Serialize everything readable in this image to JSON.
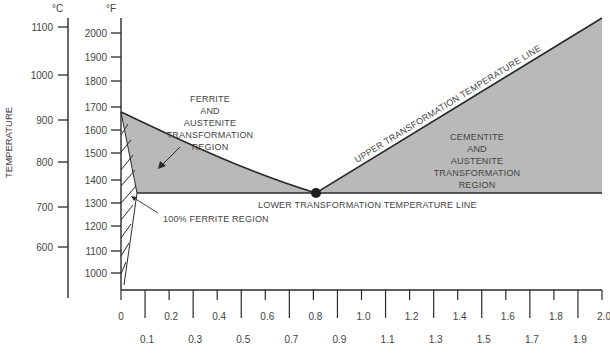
{
  "chart_data": {
    "type": "phase-diagram",
    "title": "",
    "ylabel": "TEMPERATURE",
    "xlabel": "",
    "celsius_axis": {
      "unit_label": "°C",
      "ticks": [
        {
          "value": "1100",
          "y": 27
        },
        {
          "value": "1000",
          "y": 75
        },
        {
          "value": "900",
          "y": 120
        },
        {
          "value": "800",
          "y": 162
        },
        {
          "value": "700",
          "y": 207
        },
        {
          "value": "600",
          "y": 247
        }
      ]
    },
    "fahrenheit_axis": {
      "unit_label": "°F",
      "ticks": [
        {
          "value": "2000",
          "y": 33
        },
        {
          "value": "1900",
          "y": 57
        },
        {
          "value": "1800",
          "y": 81
        },
        {
          "value": "1700",
          "y": 107
        },
        {
          "value": "1600",
          "y": 130
        },
        {
          "value": "1500",
          "y": 153
        },
        {
          "value": "1400",
          "y": 180
        },
        {
          "value": "1300",
          "y": 203
        },
        {
          "value": "1200",
          "y": 226
        },
        {
          "value": "1100",
          "y": 251
        },
        {
          "value": "1000",
          "y": 273
        }
      ]
    },
    "x_axis": {
      "range": [
        0,
        2.0
      ],
      "ticks": [
        "0",
        "0.1",
        "0.2",
        "0.3",
        "0.4",
        "0.5",
        "0.6",
        "0.7",
        "0.8",
        "0.9",
        "1.0",
        "1.1",
        "1.2",
        "1.3",
        "1.4",
        "1.5",
        "1.6",
        "1.7",
        "1.8",
        "1.9",
        "2.0"
      ]
    },
    "lines": [
      {
        "name": "UPPER TRANSFORMATION TEMPERATURE LINE",
        "points": [
          [
            0,
            1670
          ],
          [
            0.8,
            1333
          ],
          [
            2.0,
            2065
          ]
        ]
      },
      {
        "name": "LOWER TRANSFORMATION TEMPERATURE LINE",
        "points": [
          [
            0.025,
            1333
          ],
          [
            2.0,
            1333
          ]
        ]
      }
    ],
    "eutectoid_point": {
      "x": 0.8,
      "temp_f": 1333
    },
    "regions": [
      {
        "name": "FERRITE AND AUSTENITE TRANSFORMATION REGION",
        "fill": "#b9b9b9"
      },
      {
        "name": "CEMENTITE AND AUSTENITE TRANSFORMATION REGION",
        "fill": "#b9b9b9"
      },
      {
        "name": "100% FERRITE REGION",
        "fill": "hatched"
      }
    ]
  },
  "labels": {
    "celsius_unit": "°C",
    "fahrenheit_unit": "°F",
    "temperature": "TEMPERATURE",
    "ferrite_region": [
      "FERRITE",
      "AND",
      "AUSTENITE",
      "TRANSFORMATION",
      "REGION"
    ],
    "cementite_region": [
      "CEMENTITE",
      "AND",
      "AUSTENITE",
      "TRANSFORMATION",
      "REGION"
    ],
    "upper_line": "UPPER TRANSFORMATION TEMPERATURE LINE",
    "lower_line": "LOWER TRANSFORMATION TEMPERATURE LINE",
    "ferrite_100": "100% FERRITE REGION"
  },
  "colors": {
    "region_fill": "#b9b9b9",
    "line": "#2a2a2a",
    "text": "#444444"
  }
}
